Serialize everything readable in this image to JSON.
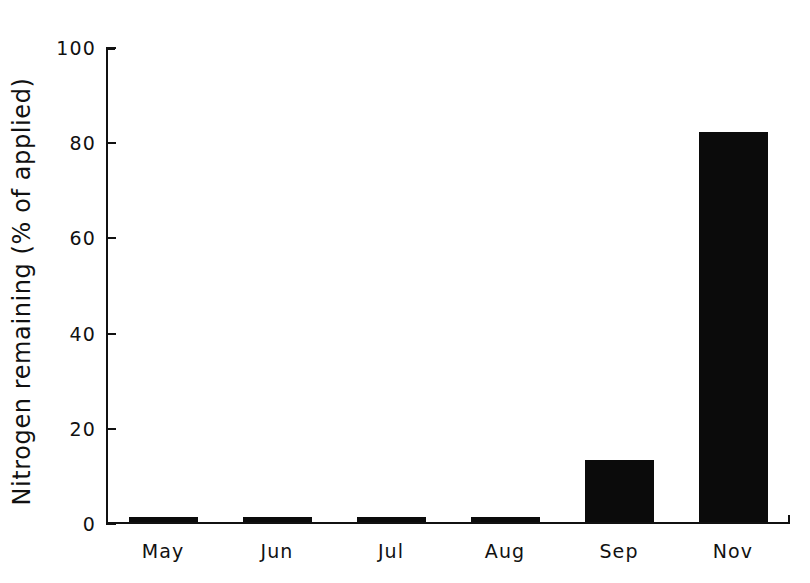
{
  "chart_data": {
    "type": "bar",
    "title": "",
    "xlabel": "",
    "ylabel": "Nitrogen remaining (% of applied)",
    "categories": [
      "May",
      "Jun",
      "Jul",
      "Aug",
      "Sep",
      "Nov"
    ],
    "values": [
      1,
      1,
      1,
      1,
      13,
      82
    ],
    "ylim": [
      0,
      100
    ],
    "ytick_labels": [
      "0",
      "20",
      "40",
      "60",
      "80",
      "100"
    ],
    "ytick_values": [
      0,
      20,
      40,
      60,
      80,
      100
    ],
    "grid": false,
    "legend": null,
    "bar_color": "#0b0b0b",
    "axis_color": "#111111",
    "background_color": "#ffffff"
  }
}
